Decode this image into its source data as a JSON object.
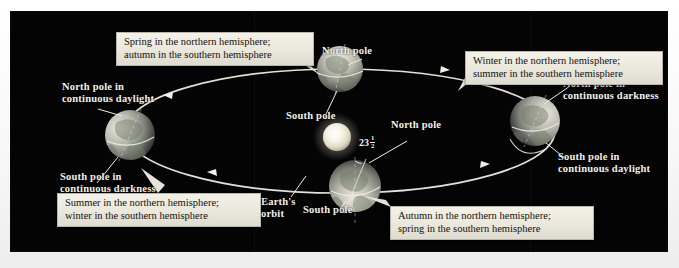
{
  "figure": {
    "background_color": "#040404",
    "label_color": "#f2f0ea",
    "callout_bg_color": "#efecE2",
    "orbit_color": "#e8e6de"
  },
  "sun": {
    "name": "Sun",
    "color": "#f4f1e2",
    "cx": 327,
    "cy": 126,
    "r": 14
  },
  "orbit": {
    "label": "Earth's\norbit",
    "cx": 330,
    "cy": 120,
    "rx": 215,
    "ry": 62
  },
  "earths": [
    {
      "id": "spring",
      "position": "top",
      "cx": 330,
      "cy": 58,
      "r": 23,
      "pole_labels": [
        {
          "id": "north-pole-top",
          "text": "North pole"
        },
        {
          "id": "south-pole-top",
          "text": "South pole"
        }
      ],
      "callout": "Spring in the northern hemisphere;\nautumn in the southern hemisphere"
    },
    {
      "id": "summer",
      "position": "left",
      "cx": 120,
      "cy": 124,
      "r": 25,
      "pole_labels": [
        {
          "id": "north-pole-left",
          "text": "North pole in\ncontinuous daylight"
        },
        {
          "id": "south-pole-left",
          "text": "South pole in\ncontinuous darkness"
        }
      ],
      "callout": "Summer in the northern hemisphere;\nwinter in the southern hemisphere"
    },
    {
      "id": "winter",
      "position": "right",
      "cx": 525,
      "cy": 110,
      "r": 25,
      "pole_labels": [
        {
          "id": "north-pole-right",
          "text": "North pole in\ncontinuous darkness"
        },
        {
          "id": "south-pole-right",
          "text": "South pole in\ncontinuous daylight"
        }
      ],
      "callout": "Winter in the northern hemisphere;\nsummer in the southern hemisphere"
    },
    {
      "id": "autumn",
      "position": "bottom",
      "cx": 345,
      "cy": 175,
      "r": 26,
      "pole_labels": [
        {
          "id": "north-pole-bottom",
          "text": "North pole"
        },
        {
          "id": "south-pole-bottom",
          "text": "South pole"
        }
      ],
      "callout": "Autumn in the northern hemisphere;\nspring in the southern hemisphere"
    }
  ],
  "tilt": {
    "value": "23",
    "fraction_numerator": "1",
    "fraction_denominator": "2",
    "degree_symbol": "°",
    "description": "axial tilt angle"
  },
  "labels": {
    "north_pole": "North pole",
    "south_pole": "South pole",
    "north_pole_daylight": "North pole in\ncontinuous daylight",
    "south_pole_darkness": "South pole in\ncontinuous darkness",
    "north_pole_darkness": "North pole in\ncontinuous darkness",
    "south_pole_daylight": "South pole in\ncontinuous daylight",
    "earths_orbit": "Earth's\norbit",
    "north_pole_bottom": "North pole",
    "south_pole_bottom": "South pole",
    "south_pole_top": "South pole",
    "north_pole_top": "North pole"
  },
  "callouts": {
    "spring": "Spring in the northern hemisphere;\nautumn in the southern hemisphere",
    "winter": "Winter in the northern hemisphere;\nsummer in the southern hemisphere",
    "summer": "Summer in the northern hemisphere;\nwinter in the southern hemisphere",
    "autumn": "Autumn in the northern hemisphere;\nspring in the southern hemisphere"
  }
}
